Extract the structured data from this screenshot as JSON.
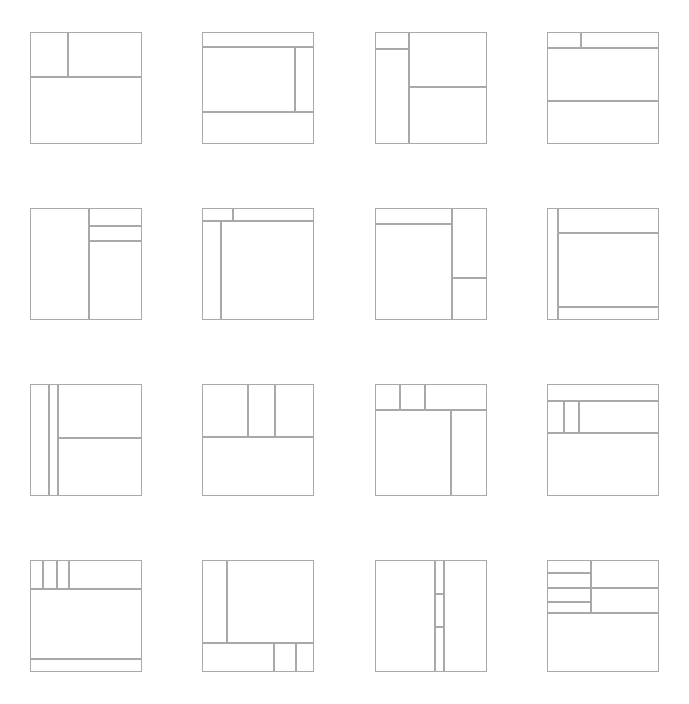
{
  "page": {
    "background_color": "#ffffff",
    "stroke_color": "#a9a9a9",
    "fill_color": "#ffffff",
    "stroke_width": 1,
    "columns": 4,
    "rows": 4,
    "thumbnail_count": 16,
    "thumbnail_width": 112,
    "thumbnail_height": 112
  },
  "thumbnails": [
    {
      "id": "layout-01",
      "name": "header-split-two-over-full-body",
      "viewbox": "0 0 112 112",
      "regions": [
        {
          "name": "top-left-panel",
          "x": 0,
          "y": 0,
          "w": 38,
          "h": 45
        },
        {
          "name": "top-right-panel",
          "x": 38,
          "y": 0,
          "w": 74,
          "h": 45
        },
        {
          "name": "main-body",
          "x": 0,
          "y": 45,
          "w": 112,
          "h": 67
        }
      ]
    },
    {
      "id": "layout-02",
      "name": "header-body-sidebar-footer",
      "viewbox": "0 0 112 112",
      "regions": [
        {
          "name": "header-bar",
          "x": 0,
          "y": 0,
          "w": 112,
          "h": 15
        },
        {
          "name": "content-area",
          "x": 0,
          "y": 15,
          "w": 93,
          "h": 65
        },
        {
          "name": "side-rail",
          "x": 93,
          "y": 15,
          "w": 19,
          "h": 65
        },
        {
          "name": "footer-bar",
          "x": 0,
          "y": 80,
          "w": 112,
          "h": 32
        }
      ]
    },
    {
      "id": "layout-03",
      "name": "sidebar-with-cap-and-stacked-main",
      "viewbox": "0 0 112 112",
      "regions": [
        {
          "name": "sidebar-cap",
          "x": 0,
          "y": 0,
          "w": 34,
          "h": 17
        },
        {
          "name": "sidebar-body",
          "x": 0,
          "y": 17,
          "w": 34,
          "h": 95
        },
        {
          "name": "main-upper-panel",
          "x": 34,
          "y": 0,
          "w": 78,
          "h": 55
        },
        {
          "name": "main-lower-panel",
          "x": 34,
          "y": 55,
          "w": 78,
          "h": 57
        }
      ]
    },
    {
      "id": "layout-04",
      "name": "split-toolbar-over-content-and-footer",
      "viewbox": "0 0 112 112",
      "regions": [
        {
          "name": "toolbar-left",
          "x": 0,
          "y": 0,
          "w": 34,
          "h": 16
        },
        {
          "name": "toolbar-right",
          "x": 34,
          "y": 0,
          "w": 78,
          "h": 16
        },
        {
          "name": "content-area",
          "x": 0,
          "y": 16,
          "w": 112,
          "h": 53
        },
        {
          "name": "footer-area",
          "x": 0,
          "y": 69,
          "w": 112,
          "h": 43
        }
      ]
    },
    {
      "id": "layout-05",
      "name": "main-left-with-right-stacked-rail",
      "viewbox": "0 0 112 112",
      "regions": [
        {
          "name": "main-column",
          "x": 0,
          "y": 0,
          "w": 59,
          "h": 112
        },
        {
          "name": "rail-panel-top",
          "x": 59,
          "y": 0,
          "w": 53,
          "h": 18
        },
        {
          "name": "rail-panel-middle",
          "x": 59,
          "y": 18,
          "w": 53,
          "h": 15
        },
        {
          "name": "rail-panel-bottom",
          "x": 59,
          "y": 33,
          "w": 53,
          "h": 79
        }
      ]
    },
    {
      "id": "layout-06",
      "name": "small-tab-header-with-narrow-rail-and-main",
      "viewbox": "0 0 112 112",
      "regions": [
        {
          "name": "tab-chip",
          "x": 0,
          "y": 0,
          "w": 31,
          "h": 13
        },
        {
          "name": "header-strip",
          "x": 31,
          "y": 0,
          "w": 81,
          "h": 13
        },
        {
          "name": "narrow-rail",
          "x": 0,
          "y": 13,
          "w": 19,
          "h": 99
        },
        {
          "name": "main-workspace",
          "x": 19,
          "y": 13,
          "w": 93,
          "h": 99
        }
      ]
    },
    {
      "id": "layout-07",
      "name": "toolbar-main-with-right-stacked-panels",
      "viewbox": "0 0 112 112",
      "regions": [
        {
          "name": "toolbar-strip",
          "x": 0,
          "y": 0,
          "w": 77,
          "h": 16
        },
        {
          "name": "main-canvas",
          "x": 0,
          "y": 16,
          "w": 77,
          "h": 96
        },
        {
          "name": "right-panel-top",
          "x": 77,
          "y": 0,
          "w": 35,
          "h": 70
        },
        {
          "name": "right-panel-bottom",
          "x": 77,
          "y": 70,
          "w": 35,
          "h": 42
        }
      ]
    },
    {
      "id": "layout-08",
      "name": "narrow-left-rail-header-content-footer",
      "viewbox": "0 0 112 112",
      "regions": [
        {
          "name": "left-edge-rail",
          "x": 0,
          "y": 0,
          "w": 11,
          "h": 112
        },
        {
          "name": "header-band",
          "x": 11,
          "y": 0,
          "w": 101,
          "h": 25
        },
        {
          "name": "content-band",
          "x": 11,
          "y": 25,
          "w": 101,
          "h": 74
        },
        {
          "name": "footer-band",
          "x": 11,
          "y": 99,
          "w": 101,
          "h": 13
        }
      ]
    },
    {
      "id": "layout-09",
      "name": "dual-left-rails-with-stacked-main",
      "viewbox": "0 0 112 112",
      "regions": [
        {
          "name": "rail-outer",
          "x": 0,
          "y": 0,
          "w": 19,
          "h": 112
        },
        {
          "name": "rail-inner",
          "x": 19,
          "y": 0,
          "w": 9,
          "h": 112
        },
        {
          "name": "main-top-panel",
          "x": 28,
          "y": 0,
          "w": 84,
          "h": 54
        },
        {
          "name": "main-bottom-panel",
          "x": 28,
          "y": 54,
          "w": 84,
          "h": 58
        }
      ]
    },
    {
      "id": "layout-10",
      "name": "three-column-header-over-body",
      "viewbox": "0 0 112 112",
      "regions": [
        {
          "name": "header-column-left",
          "x": 0,
          "y": 0,
          "w": 46,
          "h": 53
        },
        {
          "name": "header-column-middle",
          "x": 46,
          "y": 0,
          "w": 27,
          "h": 53
        },
        {
          "name": "header-column-right",
          "x": 73,
          "y": 0,
          "w": 39,
          "h": 53
        },
        {
          "name": "body-area",
          "x": 0,
          "y": 53,
          "w": 112,
          "h": 59
        }
      ]
    },
    {
      "id": "layout-11",
      "name": "tabbed-header-with-main-and-right-column",
      "viewbox": "0 0 112 112",
      "regions": [
        {
          "name": "tab-one",
          "x": 0,
          "y": 0,
          "w": 25,
          "h": 26
        },
        {
          "name": "tab-two",
          "x": 25,
          "y": 0,
          "w": 25,
          "h": 26
        },
        {
          "name": "tab-three",
          "x": 50,
          "y": 0,
          "w": 62,
          "h": 26
        },
        {
          "name": "main-canvas",
          "x": 0,
          "y": 26,
          "w": 76,
          "h": 86
        },
        {
          "name": "right-column",
          "x": 76,
          "y": 26,
          "w": 36,
          "h": 86
        }
      ]
    },
    {
      "id": "layout-12",
      "name": "banner-with-segmented-strip-over-body",
      "viewbox": "0 0 112 112",
      "regions": [
        {
          "name": "banner-strip",
          "x": 0,
          "y": 0,
          "w": 112,
          "h": 17
        },
        {
          "name": "segment-left",
          "x": 0,
          "y": 17,
          "w": 17,
          "h": 32
        },
        {
          "name": "segment-middle",
          "x": 17,
          "y": 17,
          "w": 15,
          "h": 32
        },
        {
          "name": "segment-right-wide",
          "x": 32,
          "y": 17,
          "w": 80,
          "h": 32
        },
        {
          "name": "body-area",
          "x": 0,
          "y": 49,
          "w": 112,
          "h": 63
        }
      ]
    },
    {
      "id": "layout-13",
      "name": "four-segment-toolbar-body-and-thin-footer",
      "viewbox": "0 0 112 112",
      "regions": [
        {
          "name": "toolbar-segment-1",
          "x": 0,
          "y": 0,
          "w": 13,
          "h": 29
        },
        {
          "name": "toolbar-segment-2",
          "x": 13,
          "y": 0,
          "w": 14,
          "h": 29
        },
        {
          "name": "toolbar-segment-3",
          "x": 27,
          "y": 0,
          "w": 12,
          "h": 29
        },
        {
          "name": "toolbar-segment-4",
          "x": 39,
          "y": 0,
          "w": 73,
          "h": 29
        },
        {
          "name": "body-area",
          "x": 0,
          "y": 29,
          "w": 112,
          "h": 70
        },
        {
          "name": "thin-footer",
          "x": 0,
          "y": 99,
          "w": 112,
          "h": 13
        }
      ]
    },
    {
      "id": "layout-14",
      "name": "sidebar-main-with-segmented-bottom-bar",
      "viewbox": "0 0 112 112",
      "regions": [
        {
          "name": "sidebar-column",
          "x": 0,
          "y": 0,
          "w": 25,
          "h": 83
        },
        {
          "name": "main-canvas",
          "x": 25,
          "y": 0,
          "w": 87,
          "h": 83
        },
        {
          "name": "bottom-bar-wide",
          "x": 0,
          "y": 83,
          "w": 72,
          "h": 29
        },
        {
          "name": "bottom-bar-middle",
          "x": 72,
          "y": 83,
          "w": 22,
          "h": 29
        },
        {
          "name": "bottom-bar-right",
          "x": 94,
          "y": 83,
          "w": 18,
          "h": 29
        }
      ]
    },
    {
      "id": "layout-15",
      "name": "two-panes-with-segmented-center-divider",
      "viewbox": "0 0 112 112",
      "regions": [
        {
          "name": "left-pane",
          "x": 0,
          "y": 0,
          "w": 60,
          "h": 112
        },
        {
          "name": "divider-segment-top",
          "x": 60,
          "y": 0,
          "w": 9,
          "h": 34
        },
        {
          "name": "divider-segment-mid",
          "x": 60,
          "y": 34,
          "w": 9,
          "h": 33
        },
        {
          "name": "divider-segment-low",
          "x": 60,
          "y": 67,
          "w": 9,
          "h": 45
        },
        {
          "name": "right-pane",
          "x": 69,
          "y": 0,
          "w": 43,
          "h": 112
        }
      ]
    },
    {
      "id": "layout-16",
      "name": "stacked-list-rows-with-right-panels-over-body",
      "viewbox": "0 0 112 112",
      "regions": [
        {
          "name": "list-row-1",
          "x": 0,
          "y": 0,
          "w": 44,
          "h": 13
        },
        {
          "name": "list-row-2",
          "x": 0,
          "y": 13,
          "w": 44,
          "h": 15
        },
        {
          "name": "list-row-3",
          "x": 0,
          "y": 28,
          "w": 44,
          "h": 14
        },
        {
          "name": "list-row-4",
          "x": 0,
          "y": 42,
          "w": 44,
          "h": 11
        },
        {
          "name": "right-panel-top",
          "x": 44,
          "y": 0,
          "w": 68,
          "h": 28
        },
        {
          "name": "right-panel-bottom",
          "x": 44,
          "y": 28,
          "w": 68,
          "h": 25
        },
        {
          "name": "body-area",
          "x": 0,
          "y": 53,
          "w": 112,
          "h": 59
        }
      ]
    }
  ]
}
